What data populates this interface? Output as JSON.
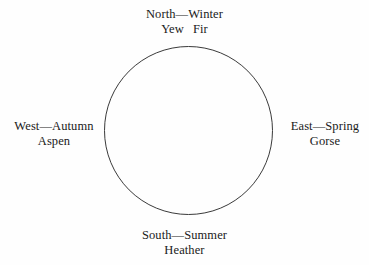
{
  "diagram": {
    "title": "",
    "shape": "circle",
    "stroke_color": "#3a3a3a",
    "fill_color": "none",
    "background_color": "#fefefe",
    "text_color": "#1a1a1a",
    "circle": {
      "center_x": 188.5,
      "center_y": 130.5,
      "radius": 84,
      "stroke_width": 1
    },
    "labels": {
      "north": {
        "line1": "North—Winter",
        "plant1": "Yew",
        "plant2": "Fir",
        "direction": "North",
        "season": "Winter"
      },
      "east": {
        "line1": "East—Spring",
        "line2": "Gorse",
        "direction": "East",
        "season": "Spring"
      },
      "south": {
        "line1": "South—Summer",
        "line2": "Heather",
        "direction": "South",
        "season": "Summer"
      },
      "west": {
        "line1": "West—Autumn",
        "line2": "Aspen",
        "direction": "West",
        "season": "Autumn"
      }
    }
  }
}
